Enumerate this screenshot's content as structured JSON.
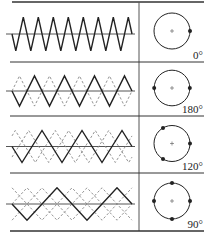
{
  "figure": {
    "type": "interleaved-triangle-waveforms-table",
    "colors": {
      "line": "#222222",
      "axis": "#555555",
      "dashed": "#888888",
      "rule": "#333333"
    },
    "rows": [
      {
        "phase_label": "0°",
        "phases": 1,
        "solid_cycles": 8,
        "dashed_traces": 0,
        "dot_angles_deg": [
          0
        ]
      },
      {
        "phase_label": "180°",
        "phases": 2,
        "solid_cycles": 4,
        "dashed_traces": 1,
        "dot_angles_deg": [
          0,
          180
        ]
      },
      {
        "phase_label": "120°",
        "phases": 3,
        "solid_cycles": 3,
        "dashed_traces": 2,
        "dot_angles_deg": [
          0,
          120,
          240
        ]
      },
      {
        "phase_label": "90°",
        "phases": 4,
        "solid_cycles": 2,
        "dashed_traces": 3,
        "dot_angles_deg": [
          0,
          90,
          180,
          270
        ]
      }
    ]
  }
}
